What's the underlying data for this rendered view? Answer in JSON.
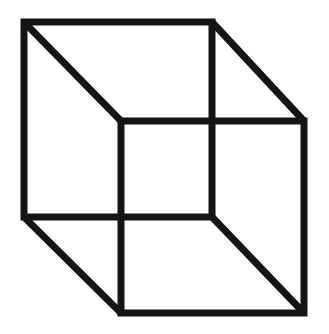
{
  "figure": {
    "name": "Necker cube",
    "type": "line-drawing",
    "canvas": {
      "width": 329,
      "height": 334,
      "background_color": "#ffffff"
    },
    "style": {
      "stroke_color": "#151515",
      "stroke_width": 7,
      "fill": "none",
      "line_cap": "butt",
      "line_join": "miter"
    },
    "geometry": {
      "vertices": {
        "back_top_left": [
          24,
          22
        ],
        "back_top_right": [
          212,
          22
        ],
        "back_bottom_right": [
          212,
          217
        ],
        "back_bottom_left": [
          24,
          217
        ],
        "front_top_left": [
          121,
          121
        ],
        "front_top_right": [
          304,
          121
        ],
        "front_bottom_right": [
          304,
          313
        ],
        "front_bottom_left": [
          121,
          313
        ]
      },
      "faces": [
        {
          "id": "back-square",
          "label": "Back square face",
          "points": "24,22 212,22 212,217 24,217"
        },
        {
          "id": "front-square",
          "label": "Front square face",
          "points": "121,121 304,121 304,313 121,313"
        }
      ],
      "connectors": [
        {
          "id": "connector-top-left",
          "label": "Top-left connecting edge",
          "x1": 24,
          "y1": 22,
          "x2": 121,
          "y2": 121
        },
        {
          "id": "connector-top-right",
          "label": "Top-right connecting edge",
          "x1": 212,
          "y1": 22,
          "x2": 304,
          "y2": 121
        },
        {
          "id": "connector-bottom-left",
          "label": "Bottom-left connecting edge",
          "x1": 24,
          "y1": 217,
          "x2": 121,
          "y2": 313
        },
        {
          "id": "connector-bottom-right",
          "label": "Bottom-right connecting edge",
          "x1": 212,
          "y1": 217,
          "x2": 304,
          "y2": 313
        }
      ]
    }
  }
}
